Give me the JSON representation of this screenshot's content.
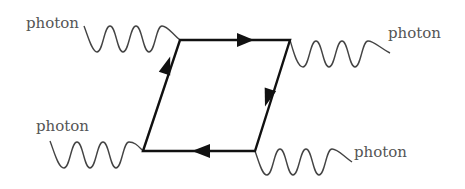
{
  "diagram": {
    "type": "feynman-box",
    "labels": {
      "top_left": "photon",
      "top_right": "photon",
      "bottom_left": "photon",
      "bottom_right": "photon"
    },
    "vertices": {
      "top_left": [
        180,
        40
      ],
      "top_right": [
        290,
        40
      ],
      "bottom_left": [
        143,
        151
      ],
      "bottom_right": [
        255,
        151
      ]
    },
    "edges": [
      {
        "from": "bottom_left",
        "to": "top_left",
        "arrow": "forward"
      },
      {
        "from": "top_left",
        "to": "top_right",
        "arrow": "forward"
      },
      {
        "from": "top_right",
        "to": "bottom_right",
        "arrow": "forward"
      },
      {
        "from": "bottom_right",
        "to": "bottom_left",
        "arrow": "forward"
      }
    ],
    "colors": {
      "fermion_line": "#111111",
      "photon_line": "#444444",
      "label": "#555555"
    }
  }
}
